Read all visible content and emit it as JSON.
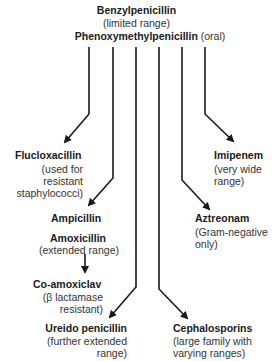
{
  "root": {
    "title": "Benzylpenicillin",
    "subtitle": "(limited range)",
    "oral_name": "Phenoxymethylpenicillin",
    "oral_note": "(oral)"
  },
  "nodes": {
    "flucloxacillin": {
      "name": "Flucloxacillin",
      "desc": [
        "(used for",
        "resistant",
        "staphylococci)"
      ]
    },
    "imipenem": {
      "name": "Imipenem",
      "desc": [
        "(very wide",
        "range)"
      ]
    },
    "ampicillin": {
      "name": "Ampicillin"
    },
    "amoxicillin": {
      "name": "Amoxicillin",
      "desc": [
        "(extended range)"
      ]
    },
    "aztreonam": {
      "name": "Aztreonam",
      "desc": [
        "(Gram-negative",
        "only)"
      ]
    },
    "co_amoxiclav": {
      "name": "Co-amoxiclav",
      "desc": [
        "(β lactamase",
        "resistant)"
      ]
    },
    "ureido": {
      "name": "Ureido penicillin",
      "desc": [
        "(further extended",
        "range)"
      ]
    },
    "cephalosporins": {
      "name": "Cephalosporins",
      "desc": [
        "(large family with",
        "varying ranges)"
      ]
    }
  },
  "colors": {
    "line": "#1a1a1a",
    "text": "#1a1a1a",
    "background": "#ffffff"
  }
}
